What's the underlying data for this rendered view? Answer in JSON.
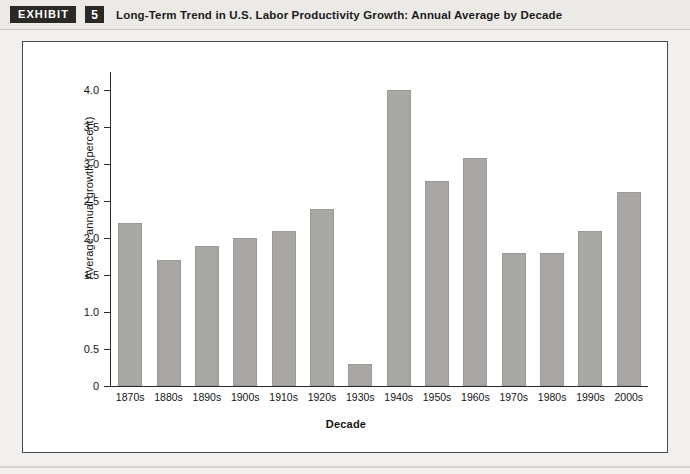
{
  "header": {
    "tag_label": "EXHIBIT",
    "number": "5",
    "title": "Long-Term Trend in U.S. Labor Productivity Growth: Annual Average by Decade"
  },
  "colors": {
    "page_background": "#f2f0ee",
    "plot_background": "#ffffff",
    "bar_fill": "#a9a7a4",
    "axis": "#2e2c2a",
    "tag_background": "#2b2926",
    "tag_text": "#ffffff"
  },
  "chart_data": {
    "type": "bar",
    "title": "Long-Term Trend in U.S. Labor Productivity Growth: Annual Average by Decade",
    "xlabel": "Decade",
    "ylabel": "Average annual growth (percent)",
    "categories": [
      "1870s",
      "1880s",
      "1890s",
      "1900s",
      "1910s",
      "1920s",
      "1930s",
      "1940s",
      "1950s",
      "1960s",
      "1970s",
      "1980s",
      "1990s",
      "2000s"
    ],
    "values": [
      2.2,
      1.7,
      1.9,
      2.0,
      2.1,
      2.4,
      0.3,
      4.0,
      2.77,
      3.08,
      1.8,
      1.8,
      2.1,
      2.63
    ],
    "ylim": [
      0,
      4.25
    ],
    "ytick_values": [
      0,
      0.5,
      1.0,
      1.5,
      2.0,
      2.5,
      3.0,
      3.5,
      4.0
    ],
    "ytick_labels": [
      "0",
      "0.5",
      "1.0",
      "1.5",
      "2.0",
      "2.5",
      "3.0",
      "3.5",
      "4.0"
    ],
    "grid": false,
    "legend": false
  }
}
